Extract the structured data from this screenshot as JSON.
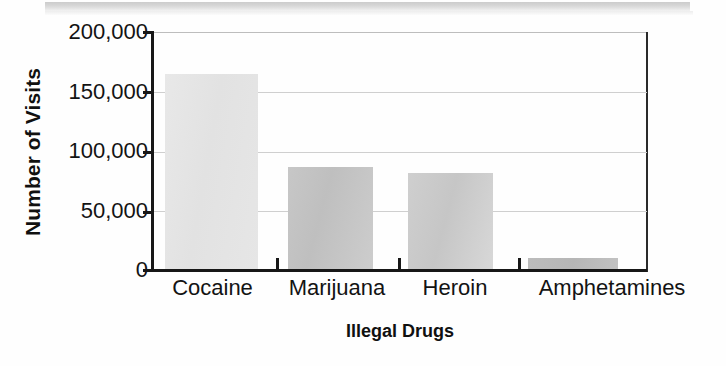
{
  "chart_data": {
    "type": "bar",
    "title": "",
    "categories": [
      "Cocaine",
      "Marijuana",
      "Heroin",
      "Amphetamines"
    ],
    "values": [
      165000,
      87000,
      82000,
      11000
    ],
    "xlabel": "Illegal Drugs",
    "ylabel": "Number of Visits",
    "ylim": [
      0,
      200000
    ],
    "ytick_values": [
      0,
      50000,
      100000,
      150000,
      200000
    ],
    "ytick_labels": [
      "0",
      "50,000",
      "100,000",
      "150,000",
      "200,000"
    ],
    "grid": true,
    "legend": "none",
    "series": [
      {
        "name": "Number of Visits",
        "values": [
          165000,
          87000,
          82000,
          11000
        ]
      }
    ],
    "bar_colors": [
      "#e4e4e4",
      "#c4c4c4",
      "#cccccc",
      "#b9b9b9"
    ]
  },
  "axes": {
    "y_title": "Number of Visits",
    "x_title": "Illegal Drugs",
    "y_labels": [
      "200,000",
      "150,000",
      "100,000",
      "50,000",
      "0"
    ],
    "x_labels": [
      "Cocaine",
      "Marijuana",
      "Heroin",
      "Amphetamines"
    ]
  },
  "colors": {
    "axis": "#171717",
    "gridline": "#cfcfcf",
    "text": "#131313",
    "background": "#fefefe",
    "artifact_strip": "#cfcfcf"
  }
}
